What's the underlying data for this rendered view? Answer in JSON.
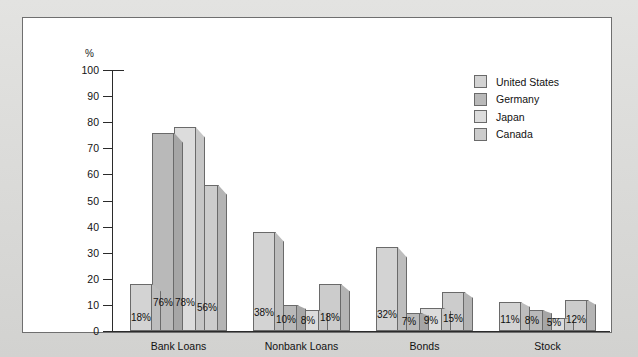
{
  "chart_data": {
    "type": "bar",
    "title": "",
    "xlabel": "",
    "ylabel": "%",
    "ylim": [
      0,
      100
    ],
    "ytick_step": 10,
    "yticks": [
      100,
      90,
      80,
      70,
      60,
      50,
      40,
      30,
      20,
      10,
      0
    ],
    "grid": false,
    "legend_position": "top-right",
    "value_suffix": "%",
    "categories": [
      "Bank Loans",
      "Nonbank Loans",
      "Bonds",
      "Stock"
    ],
    "series": [
      {
        "name": "United States",
        "color": "#d3d3d3",
        "side_color": "#bdbdbd",
        "values": [
          18,
          38,
          32,
          11
        ]
      },
      {
        "name": "Germany",
        "color": "#b9b9b9",
        "side_color": "#a6a6a6",
        "values": [
          76,
          10,
          7,
          8
        ]
      },
      {
        "name": "Japan",
        "color": "#dcdcdc",
        "side_color": "#c6c6c6",
        "values": [
          78,
          8,
          9,
          5
        ]
      },
      {
        "name": "Canada",
        "color": "#cccccc",
        "side_color": "#b4b4b4",
        "values": [
          56,
          18,
          15,
          12
        ]
      }
    ],
    "data_labels": [
      [
        "18%",
        "76%",
        "78%",
        "56%"
      ],
      [
        "38%",
        "10%",
        "8%",
        "18%"
      ],
      [
        "32%",
        "7%",
        "9%",
        "15%"
      ],
      [
        "11%",
        "8%",
        "5%",
        "12%"
      ]
    ]
  },
  "legend": {
    "items": [
      {
        "label": "United States"
      },
      {
        "label": "Germany"
      },
      {
        "label": "Japan"
      },
      {
        "label": "Canada"
      }
    ]
  }
}
